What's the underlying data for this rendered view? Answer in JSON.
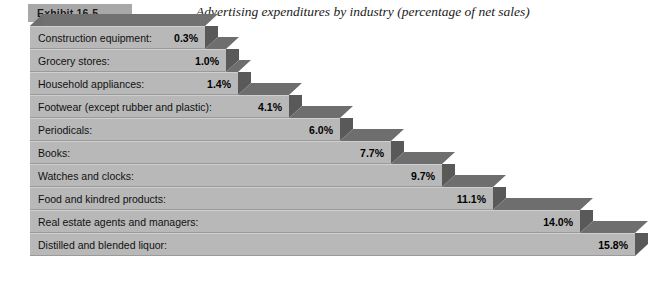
{
  "header": {
    "exhibit_label": "Exhibit 16-5",
    "title": "Advertising expenditures by industry (percentage of net sales)"
  },
  "colors": {
    "bar_face": "#b8b8b8",
    "bar_side": "#595959",
    "bar_top": "#6e6e6e",
    "badge": "#a8a8a8",
    "background": "#ffffff",
    "text": "#111111"
  },
  "chart_data": {
    "type": "bar",
    "orientation": "horizontal",
    "style": "3d-stepped",
    "title": "Advertising expenditures by industry (percentage of net sales)",
    "xlabel": "",
    "ylabel": "",
    "unit": "percent of net sales",
    "grid": false,
    "legend": null,
    "xlim": [
      0,
      15.8
    ],
    "categories": [
      "Construction equipment:",
      "Grocery stores:",
      "Household appliances:",
      "Footwear (except rubber and plastic):",
      "Periodicals:",
      "Books:",
      "Watches and clocks:",
      "Food and kindred products:",
      "Real estate agents and managers:",
      "Distilled and blended liquor:"
    ],
    "values": [
      0.3,
      1.0,
      1.4,
      4.1,
      6.0,
      7.7,
      9.7,
      11.1,
      14.0,
      15.8
    ],
    "value_labels": [
      "0.3%",
      "1.0%",
      "1.4%",
      "4.1%",
      "6.0%",
      "7.7%",
      "9.7%",
      "11.1%",
      "14.0%",
      "15.8%"
    ]
  },
  "rows": [
    {
      "label": "Construction equipment:",
      "value_label": "0.3%",
      "width": 175
    },
    {
      "label": "Grocery stores:",
      "value_label": "1.0%",
      "width": 196
    },
    {
      "label": "Household appliances:",
      "value_label": "1.4%",
      "width": 208
    },
    {
      "label": "Footwear (except rubber and plastic):",
      "value_label": "4.1%",
      "width": 259
    },
    {
      "label": "Periodicals:",
      "value_label": "6.0%",
      "width": 310
    },
    {
      "label": "Books:",
      "value_label": "7.7%",
      "width": 361
    },
    {
      "label": "Watches and clocks:",
      "value_label": "9.7%",
      "width": 412
    },
    {
      "label": "Food and kindred products:",
      "value_label": "11.1%",
      "width": 463
    },
    {
      "label": "Real estate agents and managers:",
      "value_label": "14.0%",
      "width": 550
    },
    {
      "label": "Distilled and blended liquor:",
      "value_label": "15.8%",
      "width": 605
    }
  ]
}
